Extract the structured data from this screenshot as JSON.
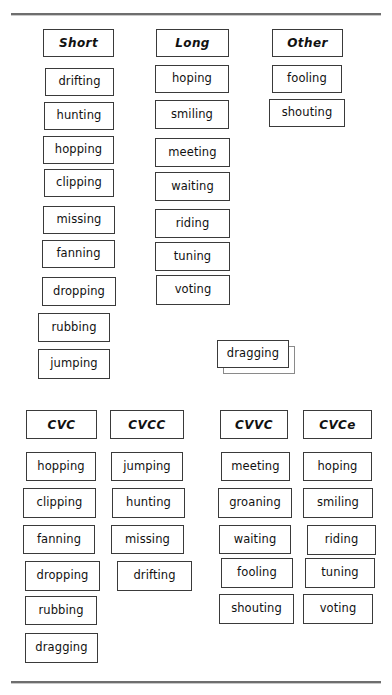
{
  "page": {
    "background": "#ffffff",
    "border_color": "#3a3a3a",
    "rule_color": "#6e6e6e"
  },
  "dividers": [
    {
      "name": "top-divider",
      "y": 13
    },
    {
      "name": "bottom-divider",
      "y": 681
    }
  ],
  "top_section": {
    "name": "vowel-sound-sort",
    "columns": [
      {
        "header": "Short",
        "x": 43,
        "w": 71,
        "header_y": 29,
        "header_h": 28,
        "items": [
          {
            "label": "drifting",
            "x": 45,
            "y": 68,
            "w": 69,
            "h": 28
          },
          {
            "label": "hunting",
            "x": 44,
            "y": 102,
            "w": 70,
            "h": 28
          },
          {
            "label": "hopping",
            "x": 43,
            "y": 136,
            "w": 71,
            "h": 28
          },
          {
            "label": "clipping",
            "x": 44,
            "y": 169,
            "w": 70,
            "h": 28
          },
          {
            "label": "missing",
            "x": 43,
            "y": 206,
            "w": 72,
            "h": 28
          },
          {
            "label": "fanning",
            "x": 42,
            "y": 240,
            "w": 73,
            "h": 28
          },
          {
            "label": "dropping",
            "x": 42,
            "y": 277,
            "w": 74,
            "h": 29
          },
          {
            "label": "rubbing",
            "x": 38,
            "y": 313,
            "w": 72,
            "h": 29
          },
          {
            "label": "jumping",
            "x": 38,
            "y": 349,
            "w": 72,
            "h": 30
          }
        ]
      },
      {
        "header": "Long",
        "x": 156,
        "w": 73,
        "header_y": 29,
        "header_h": 28,
        "items": [
          {
            "label": "hoping",
            "x": 155,
            "y": 65,
            "w": 74,
            "h": 28
          },
          {
            "label": "smiling",
            "x": 155,
            "y": 100,
            "w": 74,
            "h": 29
          },
          {
            "label": "meeting",
            "x": 155,
            "y": 138,
            "w": 75,
            "h": 29
          },
          {
            "label": "waiting",
            "x": 155,
            "y": 172,
            "w": 75,
            "h": 29
          },
          {
            "label": "riding",
            "x": 155,
            "y": 209,
            "w": 75,
            "h": 29
          },
          {
            "label": "tuning",
            "x": 155,
            "y": 242,
            "w": 75,
            "h": 29
          },
          {
            "label": "voting",
            "x": 156,
            "y": 275,
            "w": 74,
            "h": 30
          }
        ]
      },
      {
        "header": "Other",
        "x": 272,
        "w": 71,
        "header_y": 29,
        "header_h": 28,
        "items": [
          {
            "label": "fooling",
            "x": 272,
            "y": 65,
            "w": 70,
            "h": 28
          },
          {
            "label": "shouting",
            "x": 269,
            "y": 99,
            "w": 76,
            "h": 28
          }
        ]
      }
    ],
    "floating_card": {
      "label": "dragging",
      "x": 217,
      "y": 340,
      "w": 72,
      "h": 28,
      "ghost_offset_x": 6,
      "ghost_offset_y": 6
    }
  },
  "bottom_section": {
    "name": "syllable-pattern-sort",
    "columns": [
      {
        "header": "CVC",
        "x": 26,
        "w": 71,
        "header_y": 410,
        "header_h": 29,
        "items": [
          {
            "label": "hopping",
            "x": 26,
            "y": 452,
            "w": 70,
            "h": 29
          },
          {
            "label": "clipping",
            "x": 23,
            "y": 488,
            "w": 73,
            "h": 30
          },
          {
            "label": "fanning",
            "x": 23,
            "y": 525,
            "w": 72,
            "h": 29
          },
          {
            "label": "dropping",
            "x": 25,
            "y": 561,
            "w": 75,
            "h": 30
          },
          {
            "label": "rubbing",
            "x": 25,
            "y": 596,
            "w": 72,
            "h": 29
          },
          {
            "label": "dragging",
            "x": 25,
            "y": 633,
            "w": 73,
            "h": 30
          }
        ]
      },
      {
        "header": "CVCC",
        "x": 110,
        "w": 74,
        "header_y": 410,
        "header_h": 29,
        "items": [
          {
            "label": "jumping",
            "x": 111,
            "y": 452,
            "w": 72,
            "h": 29
          },
          {
            "label": "hunting",
            "x": 112,
            "y": 488,
            "w": 73,
            "h": 30
          },
          {
            "label": "missing",
            "x": 111,
            "y": 525,
            "w": 73,
            "h": 29
          },
          {
            "label": "drifting",
            "x": 117,
            "y": 561,
            "w": 75,
            "h": 30
          }
        ]
      },
      {
        "header": "CVVC",
        "x": 220,
        "w": 68,
        "header_y": 410,
        "header_h": 29,
        "items": [
          {
            "label": "meeting",
            "x": 221,
            "y": 452,
            "w": 69,
            "h": 29
          },
          {
            "label": "groaning",
            "x": 218,
            "y": 488,
            "w": 74,
            "h": 30
          },
          {
            "label": "waiting",
            "x": 219,
            "y": 525,
            "w": 72,
            "h": 29
          },
          {
            "label": "fooling",
            "x": 221,
            "y": 558,
            "w": 72,
            "h": 30
          },
          {
            "label": "shouting",
            "x": 219,
            "y": 594,
            "w": 75,
            "h": 30
          }
        ]
      },
      {
        "header": "CVCe",
        "x": 303,
        "w": 69,
        "header_y": 410,
        "header_h": 29,
        "items": [
          {
            "label": "hoping",
            "x": 303,
            "y": 452,
            "w": 69,
            "h": 29
          },
          {
            "label": "smiling",
            "x": 303,
            "y": 488,
            "w": 70,
            "h": 30
          },
          {
            "label": "riding",
            "x": 307,
            "y": 525,
            "w": 69,
            "h": 30
          },
          {
            "label": "tuning",
            "x": 305,
            "y": 558,
            "w": 70,
            "h": 30
          },
          {
            "label": "voting",
            "x": 303,
            "y": 594,
            "w": 70,
            "h": 30
          }
        ]
      }
    ]
  }
}
